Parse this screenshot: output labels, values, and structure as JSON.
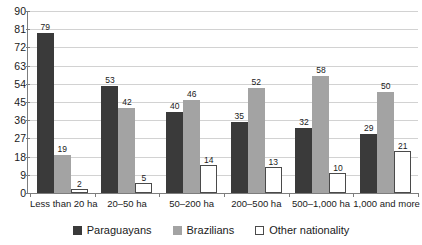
{
  "chart_data": {
    "type": "bar",
    "title": "",
    "subtitle": "",
    "xlabel": "",
    "ylabel": "",
    "ylim": [
      0,
      90
    ],
    "yticks": [
      0,
      9,
      18,
      27,
      36,
      45,
      54,
      63,
      72,
      81,
      90
    ],
    "grid": true,
    "legend_position": "bottom",
    "categories": [
      "Less than 20 ha",
      "20–50 ha",
      "50–200 ha",
      "200–500 ha",
      "500–1,000 ha",
      "1,000 and more ha"
    ],
    "series": [
      {
        "name": "Paraguayans",
        "color": "#3a3a3a",
        "values": [
          79,
          53,
          40,
          35,
          32,
          29
        ]
      },
      {
        "name": "Brazilians",
        "color": "#a3a3a3",
        "values": [
          19,
          42,
          46,
          52,
          58,
          50
        ]
      },
      {
        "name": "Other nationality",
        "color": "#ffffff",
        "values": [
          2,
          5,
          14,
          13,
          10,
          21
        ]
      }
    ]
  },
  "legend": {
    "items": [
      {
        "label": "Paraguayans",
        "swatch": "dark-square-icon"
      },
      {
        "label": "Brazilians",
        "swatch": "gray-square-icon"
      },
      {
        "label": "Other nationality",
        "swatch": "white-square-icon"
      }
    ]
  },
  "colors": {
    "paraguayans": "#3a3a3a",
    "brazilians": "#a3a3a3",
    "other": "#ffffff",
    "gridline": "#d2d2d2",
    "axis": "#7d7d7d",
    "text": "#1a1a1a",
    "background": "#ffffff"
  }
}
